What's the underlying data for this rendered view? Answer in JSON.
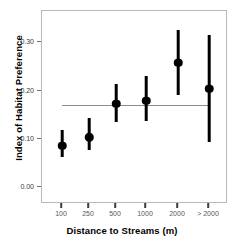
{
  "chart_data": {
    "type": "scatter",
    "title": "",
    "xlabel": "Distance to Streams (m)",
    "ylabel": "Index of Habitat Preference",
    "categories": [
      "100",
      "250",
      "500",
      "1000",
      "2000",
      "> 2000"
    ],
    "values": [
      0.086,
      0.103,
      0.173,
      0.179,
      0.258,
      0.204
    ],
    "error_low": [
      0.062,
      0.076,
      0.134,
      0.137,
      0.191,
      0.094
    ],
    "error_high": [
      0.118,
      0.143,
      0.213,
      0.231,
      0.325,
      0.315
    ],
    "ylim": [
      -0.035,
      0.365
    ],
    "yticks": [
      0.0,
      0.1,
      0.2,
      0.3
    ],
    "ytick_labels": [
      "0.00",
      "0.10",
      "0.20",
      "0.30"
    ],
    "reference_line": {
      "value": 0.171,
      "orientation": "horizontal",
      "color": "#8c8c8c",
      "x_start_category": "100",
      "x_end_category": "> 2000"
    },
    "grid": false,
    "legend": null,
    "marker": "filled-circle",
    "marker_color": "#000000",
    "errorbar_color": "#000000"
  }
}
